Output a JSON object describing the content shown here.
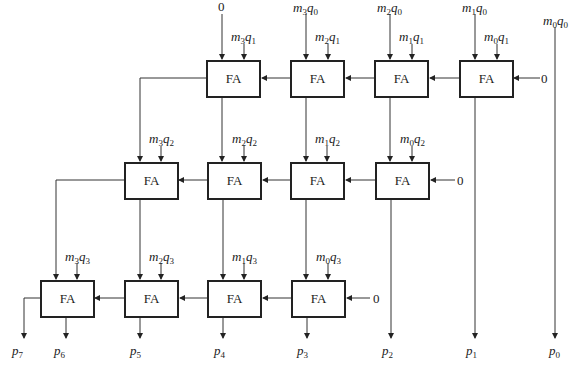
{
  "diagram": {
    "cell_label": "FA",
    "constant_zero": "0",
    "rows": [
      {
        "cells": [
          {
            "x": 206,
            "y": 60,
            "top_in": {
              "base": "0",
              "sub": ""
            },
            "pp": {
              "m": "3",
              "q": "1"
            }
          },
          {
            "x": 290,
            "y": 60,
            "top_in": {
              "m": "3",
              "q": "0"
            },
            "pp": {
              "m": "2",
              "q": "1"
            }
          },
          {
            "x": 374,
            "y": 60,
            "top_in": {
              "m": "2",
              "q": "0"
            },
            "pp": {
              "m": "1",
              "q": "1"
            }
          },
          {
            "x": 459,
            "y": 60,
            "top_in": {
              "m": "1",
              "q": "0"
            },
            "pp": {
              "m": "0",
              "q": "1"
            }
          }
        ]
      },
      {
        "cells": [
          {
            "x": 124,
            "y": 162,
            "pp": {
              "m": "3",
              "q": "2"
            }
          },
          {
            "x": 207,
            "y": 162,
            "pp": {
              "m": "2",
              "q": "2"
            }
          },
          {
            "x": 290,
            "y": 162,
            "pp": {
              "m": "1",
              "q": "2"
            }
          },
          {
            "x": 375,
            "y": 162,
            "pp": {
              "m": "0",
              "q": "2"
            }
          }
        ]
      },
      {
        "cells": [
          {
            "x": 40,
            "y": 280,
            "pp": {
              "m": "3",
              "q": "3"
            }
          },
          {
            "x": 124,
            "y": 280,
            "pp": {
              "m": "2",
              "q": "3"
            }
          },
          {
            "x": 207,
            "y": 280,
            "pp": {
              "m": "1",
              "q": "3"
            }
          },
          {
            "x": 291,
            "y": 280,
            "pp": {
              "m": "0",
              "q": "3"
            }
          }
        ]
      }
    ],
    "m0q0": {
      "m": "0",
      "q": "0"
    },
    "outputs": [
      {
        "name": "p",
        "sub": "7",
        "x": 18
      },
      {
        "name": "p",
        "sub": "6",
        "x": 60
      },
      {
        "name": "p",
        "sub": "5",
        "x": 136
      },
      {
        "name": "p",
        "sub": "4",
        "x": 220
      },
      {
        "name": "p",
        "sub": "3",
        "x": 303
      },
      {
        "name": "p",
        "sub": "2",
        "x": 388
      },
      {
        "name": "p",
        "sub": "1",
        "x": 472
      },
      {
        "name": "p",
        "sub": "0",
        "x": 555
      }
    ]
  }
}
